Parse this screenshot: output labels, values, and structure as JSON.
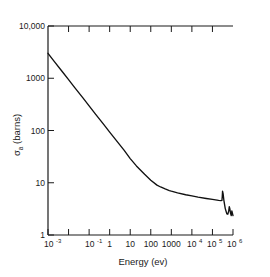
{
  "chart_data": {
    "type": "line",
    "title": "",
    "xlabel": "Energy (ev)",
    "ylabel": "σa (barns)",
    "ylabel_symbol": "σ",
    "ylabel_subscript": "a",
    "ylabel_unit": "(barns)",
    "xscale": "log",
    "yscale": "log",
    "xlim": [
      0.001,
      1000000
    ],
    "ylim": [
      1,
      10000
    ],
    "grid": false,
    "legend": null,
    "xticklabels": [
      "10",
      "10",
      "1",
      "10",
      "100",
      "1000",
      "10",
      "10",
      "10"
    ],
    "xtick_mantissa": [
      "10",
      "10",
      "1",
      "10",
      "100",
      "1000",
      "10",
      "10",
      "10"
    ],
    "xtick_exponents": [
      "-3",
      "-1",
      "",
      "",
      "",
      "",
      "4",
      "5",
      "6"
    ],
    "xtick_values": [
      0.001,
      0.1,
      1,
      10,
      100,
      1000,
      10000,
      100000,
      1000000
    ],
    "yticklabels": [
      "10,000",
      "1000",
      "100",
      "10",
      "1"
    ],
    "ytick_values": [
      10000,
      1000,
      100,
      10,
      1
    ],
    "series": [
      {
        "name": "absorption cross section",
        "color": "#111111",
        "x": [
          0.001,
          0.002,
          0.005,
          0.01,
          0.02,
          0.05,
          0.1,
          0.2,
          0.5,
          1,
          2,
          5,
          10,
          20,
          50,
          100,
          200,
          300,
          500,
          800,
          1000,
          2000,
          5000,
          10000,
          20000,
          50000,
          100000,
          200000,
          260000,
          290000,
          300000,
          310000,
          330000,
          360000,
          420000,
          500000,
          560000,
          620000,
          660000,
          700000,
          760000,
          820000,
          880000,
          940000,
          1000000
        ],
        "y": [
          3000,
          2100,
          1330,
          940,
          660,
          420,
          295,
          208,
          132,
          93,
          66,
          42,
          29,
          21,
          14.5,
          11.2,
          9.0,
          8.3,
          7.6,
          7.1,
          6.9,
          6.4,
          5.9,
          5.6,
          5.3,
          5.0,
          4.8,
          4.6,
          4.55,
          4.6,
          5.4,
          6.9,
          6.2,
          4.6,
          3.2,
          2.55,
          2.5,
          2.9,
          3.5,
          3.2,
          2.6,
          2.35,
          2.9,
          2.6,
          2.35
        ]
      }
    ],
    "annotations": [
      {
        "text": "1/v absorption region",
        "x": 0.001,
        "y": 3000
      },
      {
        "text": "resonance",
        "x": 300000,
        "y": 6.9
      }
    ]
  }
}
